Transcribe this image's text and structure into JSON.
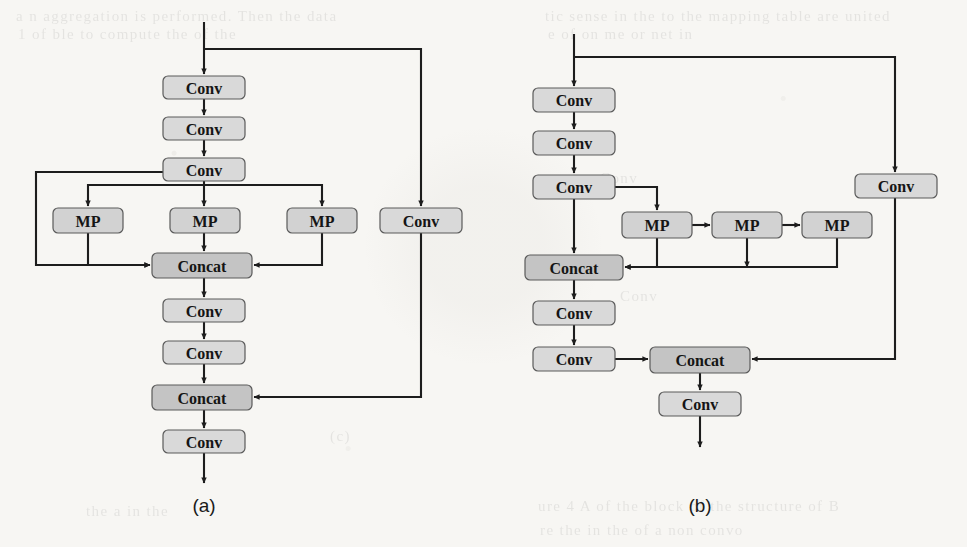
{
  "figure": {
    "type": "diagram",
    "panels": [
      {
        "id": "a",
        "caption": "(a)",
        "nodes": [
          {
            "id": "a_conv1",
            "label": "Conv",
            "kind": "conv",
            "x": 163,
            "y": 76,
            "w": 82,
            "h": 23
          },
          {
            "id": "a_conv2",
            "label": "Conv",
            "kind": "conv",
            "x": 163,
            "y": 117,
            "w": 82,
            "h": 23
          },
          {
            "id": "a_conv3",
            "label": "Conv",
            "kind": "conv",
            "x": 163,
            "y": 158,
            "w": 82,
            "h": 23
          },
          {
            "id": "a_mp1",
            "label": "MP",
            "kind": "mp",
            "x": 53,
            "y": 208,
            "w": 70,
            "h": 25
          },
          {
            "id": "a_mp2",
            "label": "MP",
            "kind": "mp",
            "x": 170,
            "y": 208,
            "w": 70,
            "h": 25
          },
          {
            "id": "a_mp3",
            "label": "MP",
            "kind": "mp",
            "x": 287,
            "y": 208,
            "w": 70,
            "h": 25
          },
          {
            "id": "a_convr",
            "label": "Conv",
            "kind": "conv",
            "x": 380,
            "y": 208,
            "w": 82,
            "h": 25
          },
          {
            "id": "a_concat1",
            "label": "Concat",
            "kind": "concat",
            "x": 152,
            "y": 253,
            "w": 100,
            "h": 25
          },
          {
            "id": "a_conv4",
            "label": "Conv",
            "kind": "conv",
            "x": 163,
            "y": 299,
            "w": 82,
            "h": 23
          },
          {
            "id": "a_conv5",
            "label": "Conv",
            "kind": "conv",
            "x": 163,
            "y": 341,
            "w": 82,
            "h": 23
          },
          {
            "id": "a_concat2",
            "label": "Concat",
            "kind": "concat",
            "x": 152,
            "y": 385,
            "w": 100,
            "h": 25
          },
          {
            "id": "a_conv6",
            "label": "Conv",
            "kind": "conv",
            "x": 163,
            "y": 430,
            "w": 82,
            "h": 23
          }
        ],
        "caption_pos": {
          "x": 204,
          "y": 505
        }
      },
      {
        "id": "b",
        "caption": "(b)",
        "nodes": [
          {
            "id": "b_conv1",
            "label": "Conv",
            "kind": "conv",
            "x": 533,
            "y": 88,
            "w": 82,
            "h": 24
          },
          {
            "id": "b_conv2",
            "label": "Conv",
            "kind": "conv",
            "x": 533,
            "y": 131,
            "w": 82,
            "h": 24
          },
          {
            "id": "b_conv3",
            "label": "Conv",
            "kind": "conv",
            "x": 533,
            "y": 175,
            "w": 82,
            "h": 24
          },
          {
            "id": "b_convr",
            "label": "Conv",
            "kind": "conv",
            "x": 855,
            "y": 174,
            "w": 82,
            "h": 24
          },
          {
            "id": "b_mp1",
            "label": "MP",
            "kind": "mp",
            "x": 622,
            "y": 212,
            "w": 70,
            "h": 26
          },
          {
            "id": "b_mp2",
            "label": "MP",
            "kind": "mp",
            "x": 712,
            "y": 212,
            "w": 70,
            "h": 26
          },
          {
            "id": "b_mp3",
            "label": "MP",
            "kind": "mp",
            "x": 802,
            "y": 212,
            "w": 70,
            "h": 26
          },
          {
            "id": "b_concat1",
            "label": "Concat",
            "kind": "concat",
            "x": 525,
            "y": 255,
            "w": 98,
            "h": 25
          },
          {
            "id": "b_conv4",
            "label": "Conv",
            "kind": "conv",
            "x": 533,
            "y": 301,
            "w": 82,
            "h": 24
          },
          {
            "id": "b_conv5",
            "label": "Conv",
            "kind": "conv",
            "x": 533,
            "y": 347,
            "w": 82,
            "h": 24
          },
          {
            "id": "b_concat2",
            "label": "Concat",
            "kind": "concat",
            "x": 650,
            "y": 347,
            "w": 100,
            "h": 26
          },
          {
            "id": "b_conv6",
            "label": "Conv",
            "kind": "conv",
            "x": 659,
            "y": 392,
            "w": 82,
            "h": 24
          }
        ],
        "caption_pos": {
          "x": 700,
          "y": 505
        }
      }
    ],
    "edges_a": [
      "M204,22 L204,74",
      "M204,49 L421,49 L421,206",
      "M204,99 L204,115",
      "M204,140 L204,156",
      "M204,181 L204,206",
      "M163,172 L36,172 L36,265 L150,265",
      "M204,185 L88,185 L88,206",
      "M204,185 L322,185 L322,206",
      "M88,233 L88,265 L150,265",
      "M204,233 L204,251",
      "M322,233 L322,265 L254,265",
      "M204,278 L204,297",
      "M204,322 L204,339",
      "M204,364 L204,383",
      "M421,233 L421,397 L254,397",
      "M204,410 L204,428",
      "M204,453 L204,483"
    ],
    "edges_b": [
      "M574,34 L574,86",
      "M574,57 L895,57 L895,172",
      "M574,112 L574,129",
      "M574,155 L574,173",
      "M574,199 L574,253",
      "M615,187 L657,187 L657,210",
      "M692,225 L710,225",
      "M782,225 L800,225",
      "M657,238 L657,267 L625,267",
      "M747,238 L747,267",
      "M837,238 L837,267 L625,267",
      "M574,280 L574,299",
      "M574,325 L574,345",
      "M615,359 L648,359",
      "M895,198 L895,359 L752,359",
      "M700,373 L700,390",
      "M700,416 L700,447"
    ],
    "arrow_marker": "triangle-arrowhead",
    "colors": {
      "page_background": "#f7f6f3",
      "node_fill_conv": "#d9d9d9",
      "node_fill_concat": "#c4c4c4",
      "node_stroke": "#5a5a5a",
      "edge": "#1d1d1d",
      "text": "#151515"
    },
    "bleed_text": [
      {
        "text": "a n aggregation is performed. Then the data",
        "x": 16,
        "y": 8,
        "flip": false
      },
      {
        "text": "tic sense in the to the mapping table are united",
        "x": 545,
        "y": 8,
        "flip": false
      },
      {
        "text": "1 of ble to compute the of the",
        "x": 18,
        "y": 26,
        "flip": false
      },
      {
        "text": "e of on me or net in",
        "x": 548,
        "y": 26,
        "flip": false
      },
      {
        "text": "Conv",
        "x": 600,
        "y": 170,
        "flip": false
      },
      {
        "text": "(c)",
        "x": 330,
        "y": 428,
        "flip": false
      },
      {
        "text": "Conv",
        "x": 620,
        "y": 288,
        "flip": false
      },
      {
        "text": "the a in the",
        "x": 86,
        "y": 503,
        "flip": false
      },
      {
        "text": "ure 4 A of the block of the structure of B",
        "x": 538,
        "y": 498,
        "flip": false
      },
      {
        "text": "re the in the of a non convo",
        "x": 540,
        "y": 522,
        "flip": false
      }
    ]
  }
}
